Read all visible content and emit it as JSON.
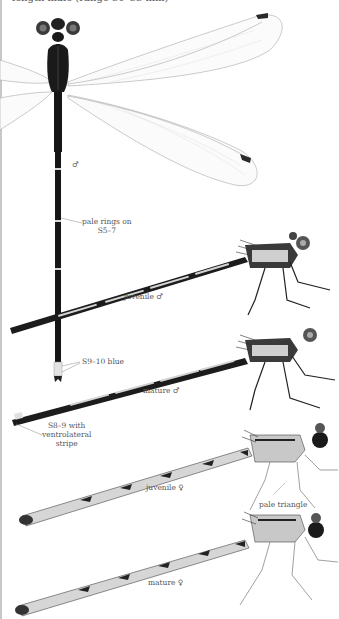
{
  "page": {
    "header_partial": "length male (range 30–33 mm)"
  },
  "illustrations": [
    {
      "id": "male-dorsal",
      "label": "♂"
    },
    {
      "id": "juvenile-male",
      "label": "juvenile ♂"
    },
    {
      "id": "mature-male",
      "label": "mature ♂"
    },
    {
      "id": "juvenile-female",
      "label": "juvenile ♀"
    },
    {
      "id": "mature-female",
      "label": "mature ♀"
    }
  ],
  "annotations": {
    "pale_rings": [
      "pale rings on",
      "S5–7"
    ],
    "s9_10": "S9–10 blue",
    "s8_9": [
      "S8–9 with",
      "ventrolateral",
      "stripe"
    ],
    "pale_triangle": "pale triangle"
  },
  "colors": {
    "body_dark": "#1a1a1a",
    "body_pale": "#d8d8d8",
    "wing_vein": "#9a9a9a",
    "pterostigma": "#2a2a2a",
    "leader_line": "#888888"
  }
}
